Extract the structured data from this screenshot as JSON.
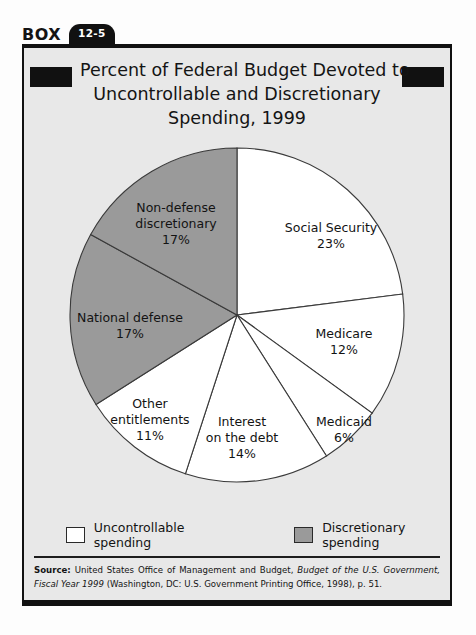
{
  "box": {
    "label": "BOX",
    "number": "12-5"
  },
  "chart_title_lines": [
    "Percent of Federal Budget Devoted to",
    "Uncontrollable and Discretionary",
    "Spending, 1999"
  ],
  "chart_data": {
    "type": "pie",
    "title": "Percent of Federal Budget Devoted to Uncontrollable and Discretionary Spending, 1999",
    "xlabel": "",
    "ylabel": "",
    "legend_position": "bottom",
    "grid": false,
    "categories": [
      "Social Security",
      "Medicare",
      "Medicaid",
      "Interest on the debt",
      "Other entitlements",
      "National defense",
      "Non-defense discretionary"
    ],
    "values": [
      23,
      12,
      6,
      14,
      11,
      17,
      17
    ],
    "value_labels": [
      "23%",
      "12%",
      "6%",
      "14%",
      "11%",
      "17%",
      "17%"
    ],
    "groups": [
      "Uncontrollable spending",
      "Uncontrollable spending",
      "Uncontrollable spending",
      "Uncontrollable spending",
      "Uncontrollable spending",
      "Discretionary spending",
      "Discretionary spending"
    ],
    "slice_colors": [
      "#ffffff",
      "#ffffff",
      "#ffffff",
      "#ffffff",
      "#ffffff",
      "#9a9a9a",
      "#9a9a9a"
    ],
    "start_angle_deg": 0,
    "direction": "clockwise"
  },
  "slice_labels": [
    {
      "name": "Social Security",
      "line1": "Social Security",
      "line2": "23%"
    },
    {
      "name": "Medicare",
      "line1": "Medicare",
      "line2": "12%"
    },
    {
      "name": "Medicaid",
      "line1": "Medicaid",
      "line2": "6%"
    },
    {
      "name": "Interest on the debt",
      "line1": "Interest",
      "line2": "on the debt",
      "line3": "14%"
    },
    {
      "name": "Other entitlements",
      "line1": "Other",
      "line2": "entitlements",
      "line3": "11%"
    },
    {
      "name": "National defense",
      "line1": "National defense",
      "line2": "17%"
    },
    {
      "name": "Non-defense discretionary",
      "line1": "Non-defense",
      "line2": "discretionary",
      "line3": "17%"
    }
  ],
  "legend": [
    {
      "label": "Uncontrollable spending",
      "color": "#ffffff"
    },
    {
      "label": "Discretionary spending",
      "color": "#9a9a9a"
    }
  ],
  "source": {
    "label": "Source:",
    "text_1": " United States Office of Management and Budget, ",
    "italic_1": "Budget of the U.S. Government, Fiscal Year 1999",
    "text_2": " (Washington, DC: U.S. Government Printing Office, 1998), p. 51."
  },
  "colors": {
    "ink": "#111111",
    "box_background": "#e8e8e8",
    "discretionary_gray": "#9a9a9a",
    "uncontrollable_white": "#ffffff"
  }
}
